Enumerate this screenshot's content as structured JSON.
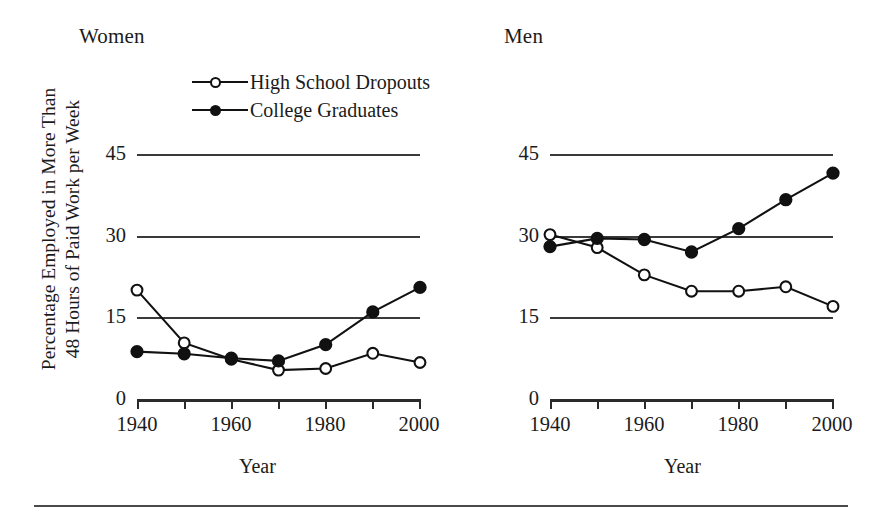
{
  "figure": {
    "panels": [
      {
        "key": "women",
        "title": "Women"
      },
      {
        "key": "men",
        "title": "Men"
      }
    ],
    "ylabel_line1": "Percentage Employed in More Than",
    "ylabel_line2": "48 Hours of Paid Work per Week",
    "xlabel": "Year",
    "legend": [
      {
        "label": "High School Dropouts",
        "marker": "open-circle"
      },
      {
        "label": "College Graduates",
        "marker": "filled-circle"
      }
    ],
    "y_ticks": [
      "0",
      "15",
      "30",
      "45"
    ],
    "x_ticks": [
      "1940",
      "1960",
      "1980",
      "2000"
    ],
    "colors": {
      "ink": "#111111",
      "grid": "#3a3a3a",
      "axis": "#2b2b2b"
    }
  },
  "chart_data": [
    {
      "type": "line",
      "title": "Women",
      "xlabel": "Year",
      "ylabel": "Percentage Employed in More Than 48 Hours of Paid Work per Week",
      "x": [
        1940,
        1950,
        1960,
        1970,
        1980,
        1990,
        2000
      ],
      "xticks": [
        1940,
        1960,
        1980,
        2000
      ],
      "xlim": [
        1940,
        2000
      ],
      "yticks": [
        0,
        15,
        30,
        45
      ],
      "ylim": [
        0,
        47
      ],
      "grid": "horizontal",
      "legend": "inside-top",
      "series": [
        {
          "name": "High School Dropouts",
          "marker": "open-circle",
          "values": [
            20.0,
            10.3,
            7.3,
            5.3,
            5.6,
            8.4,
            6.7
          ]
        },
        {
          "name": "College Graduates",
          "marker": "filled-circle",
          "values": [
            8.7,
            8.3,
            7.5,
            7.0,
            10.0,
            16.0,
            20.5
          ]
        }
      ]
    },
    {
      "type": "line",
      "title": "Men",
      "xlabel": "Year",
      "ylabel": "Percentage Employed in More Than 48 Hours of Paid Work per Week",
      "x": [
        1940,
        1950,
        1960,
        1970,
        1980,
        1990,
        2000
      ],
      "xticks": [
        1940,
        1960,
        1980,
        2000
      ],
      "xlim": [
        1940,
        2000
      ],
      "yticks": [
        0,
        15,
        30,
        45
      ],
      "ylim": [
        0,
        47
      ],
      "grid": "horizontal",
      "legend": "none",
      "series": [
        {
          "name": "High School Dropouts",
          "marker": "open-circle",
          "values": [
            30.2,
            27.8,
            22.8,
            19.8,
            19.8,
            20.6,
            17.0
          ]
        },
        {
          "name": "College Graduates",
          "marker": "filled-circle",
          "values": [
            28.0,
            29.5,
            29.3,
            27.0,
            31.3,
            36.6,
            41.5
          ]
        }
      ]
    }
  ]
}
